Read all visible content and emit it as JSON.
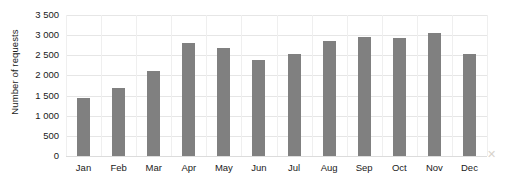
{
  "chart_data": {
    "type": "bar",
    "title": "",
    "subtitle": "",
    "xlabel": "",
    "ylabel": "Number of requests",
    "categories": [
      "Jan",
      "Feb",
      "Mar",
      "Apr",
      "May",
      "Jun",
      "Jul",
      "Aug",
      "Sep",
      "Oct",
      "Nov",
      "Dec"
    ],
    "values": [
      1430,
      1680,
      2100,
      2800,
      2670,
      2380,
      2520,
      2850,
      2950,
      2920,
      3050,
      2520
    ],
    "series": [
      {
        "name": "Number of requests",
        "values": [
          1430,
          1680,
          2100,
          2800,
          2670,
          2380,
          2520,
          2850,
          2950,
          2920,
          3050,
          2520
        ]
      }
    ],
    "ylim": [
      0,
      3500
    ],
    "ytick_values": [
      0,
      500,
      1000,
      1500,
      2000,
      2500,
      3000,
      3500
    ],
    "ytick_labels": [
      "0",
      "500",
      "1 000",
      "1 500",
      "2 000",
      "2 500",
      "3 000",
      "3 500"
    ],
    "grid": "horizontal",
    "legend": "none",
    "bar_color": "#808080",
    "gridline_color": "#e6e6e6",
    "background_color": "#ffffff",
    "text_color": "#1a1a1a",
    "annotations": []
  },
  "artifact": {
    "mark": "✕"
  }
}
